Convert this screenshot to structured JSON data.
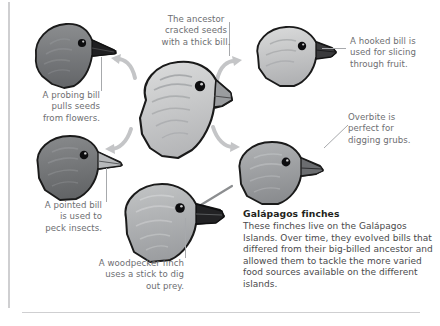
{
  "figure": {
    "caption": {
      "title": "Galápagos finches",
      "body": "These finches live on the Galápagos Islands. Over time, they evolved bills that differed from their big-billed ancestor and allowed them to tackle the more varied food sources available on the different islands."
    },
    "callouts": [
      {
        "id": "ancestor",
        "text": "The ancestor\ncracked seeds\nwith a thick bill.",
        "align": "center"
      },
      {
        "id": "probing-bill",
        "text": "A probing bill\npulls seeds\nfrom flowers.",
        "align": "right"
      },
      {
        "id": "hooked-bill",
        "text": "A hooked bill is\nused for slicing\nthrough fruit.",
        "align": "left"
      },
      {
        "id": "overbite",
        "text": "Overbite is\nperfect for\ndigging grubs.",
        "align": "left"
      },
      {
        "id": "pointed-bill",
        "text": "A pointed bill\nis used to\npeck insects.",
        "align": "right"
      },
      {
        "id": "woodpecker-finch",
        "text": "A woodpecker finch\nuses a stick to dig\nout prey.",
        "align": "right"
      }
    ],
    "birds": [
      {
        "id": "probing-finch",
        "label": "Probing-bill finch head",
        "bill": "long slender probing bill",
        "tone": "dark"
      },
      {
        "id": "ancestor-finch",
        "label": "Ancestor finch head",
        "bill": "thick heavy seed-cracking bill",
        "tone": "light"
      },
      {
        "id": "hooked-finch",
        "label": "Hooked-bill finch head",
        "bill": "short hooked bill",
        "tone": "light"
      },
      {
        "id": "overbite-finch",
        "label": "Overbite finch head",
        "bill": "overbite bill",
        "tone": "medium"
      },
      {
        "id": "pointed-finch",
        "label": "Pointed-bill finch head",
        "bill": "pointed bill",
        "tone": "dark"
      },
      {
        "id": "woodpecker-finch",
        "label": "Woodpecker finch head",
        "bill": "stout bill holding a stick",
        "tone": "medium"
      }
    ],
    "arrows": [
      {
        "id": "arrow-upper-left",
        "from": "ancestor-finch",
        "to": "probing-finch"
      },
      {
        "id": "arrow-lower-left",
        "from": "ancestor-finch",
        "to": "pointed-finch"
      },
      {
        "id": "arrow-upper-right",
        "from": "ancestor-finch",
        "to": "hooked-finch"
      },
      {
        "id": "arrow-lower-right",
        "from": "ancestor-finch",
        "to": "overbite-finch"
      }
    ],
    "colors": {
      "text": "#6d6e71",
      "caption_title": "#231f20",
      "caption_body": "#4a4a4c",
      "rule": "#cfcfd1",
      "leader": "#a7a9ac",
      "arrow": "#c4c5c7",
      "bird_dark": "#6f7173",
      "bird_medium": "#9b9da0",
      "bird_light": "#c9cacb",
      "bill_dark": "#2b2b2d",
      "outline": "#1a1a1a"
    }
  }
}
